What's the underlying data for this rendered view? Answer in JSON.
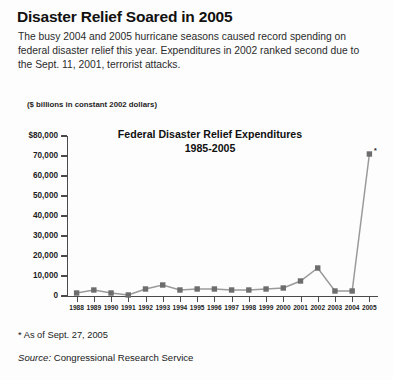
{
  "headline": "Disaster Relief Soared in 2005",
  "deck": "The busy 2004 and 2005 hurricane seasons caused record spending on federal disaster relief this year. Expenditures in 2002 ranked second due to the Sept. 11, 2001, terrorist attacks.",
  "units_caption": "($ billions in constant 2002 dollars)",
  "footnote": "* As of Sept. 27, 2005",
  "source_label": "Source:",
  "source_value": "Congressional Research Service",
  "marker_asterisk": "*",
  "colors": {
    "line": "#9a9a9a",
    "marker": "#6d6d6d",
    "axis": "#4a4a4a",
    "text": "#1a1a1a",
    "background": "#fdfdfd"
  },
  "chart_data": {
    "type": "line",
    "title": "Federal Disaster Relief Expenditures",
    "subtitle": "1985-2005",
    "xlabel": "",
    "ylabel": "($ billions in constant 2002 dollars)",
    "ylim": [
      0,
      80000
    ],
    "ytick_labels": [
      "$80,000",
      "70,000",
      "60,000",
      "50,000",
      "40,000",
      "30,000",
      "20,000",
      "10,000",
      "0"
    ],
    "ytick_values": [
      80000,
      70000,
      60000,
      50000,
      40000,
      30000,
      20000,
      10000,
      0
    ],
    "grid": false,
    "legend": "none",
    "categories": [
      "1988",
      "1989",
      "1990",
      "1991",
      "1992",
      "1993",
      "1994",
      "1995",
      "1996",
      "1997",
      "1998",
      "1999",
      "2000",
      "2001",
      "2002",
      "2003",
      "2004",
      "2005"
    ],
    "values": [
      1500,
      3000,
      1500,
      500,
      3500,
      5500,
      3000,
      3500,
      3500,
      3000,
      3000,
      3500,
      4000,
      7500,
      14000,
      2500,
      2500,
      71000
    ],
    "annotations": [
      {
        "category": "2005",
        "text": "*",
        "note": "As of Sept. 27, 2005"
      }
    ]
  }
}
